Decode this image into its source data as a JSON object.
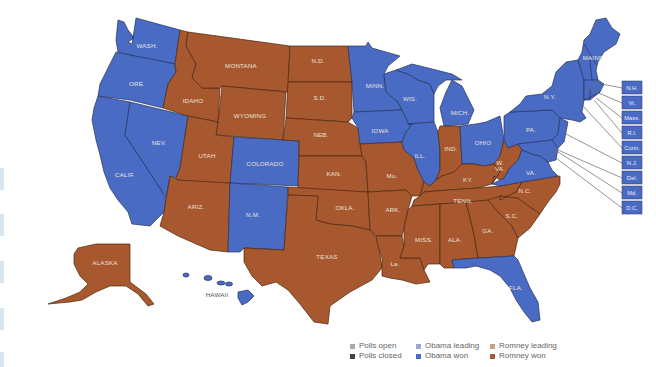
{
  "colors": {
    "obama_won": "#4a6bc4",
    "romney_won": "#a8582f",
    "polls_open": "#a9a9a9",
    "polls_closed": "#444444",
    "obama_leading": "#9aa8cf",
    "romney_leading": "#c9a08a"
  },
  "states": {
    "WA": {
      "label": "WASH.",
      "winner": "obama"
    },
    "OR": {
      "label": "ORE.",
      "winner": "obama"
    },
    "CA": {
      "label": "CALIF.",
      "winner": "obama"
    },
    "NV": {
      "label": "NEV.",
      "winner": "obama"
    },
    "ID": {
      "label": "IDAHO",
      "winner": "romney"
    },
    "MT": {
      "label": "MONTANA",
      "winner": "romney"
    },
    "WY": {
      "label": "WYOMING",
      "winner": "romney"
    },
    "UT": {
      "label": "UTAH",
      "winner": "romney"
    },
    "CO": {
      "label": "COLORADO",
      "winner": "obama"
    },
    "AZ": {
      "label": "ARIZ.",
      "winner": "romney"
    },
    "NM": {
      "label": "N.M.",
      "winner": "obama"
    },
    "ND": {
      "label": "N.D.",
      "winner": "romney"
    },
    "SD": {
      "label": "S.D.",
      "winner": "romney"
    },
    "NE": {
      "label": "NEB.",
      "winner": "romney"
    },
    "KS": {
      "label": "KAN.",
      "winner": "romney"
    },
    "OK": {
      "label": "OKLA.",
      "winner": "romney"
    },
    "TX": {
      "label": "TEXAS",
      "winner": "romney"
    },
    "MN": {
      "label": "MINN.",
      "winner": "obama"
    },
    "IA": {
      "label": "IOWA",
      "winner": "obama"
    },
    "MO": {
      "label": "Mo.",
      "winner": "romney"
    },
    "AR": {
      "label": "ARK.",
      "winner": "romney"
    },
    "LA": {
      "label": "La.",
      "winner": "romney"
    },
    "WI": {
      "label": "WIS.",
      "winner": "obama"
    },
    "IL": {
      "label": "ILL.",
      "winner": "obama"
    },
    "MI": {
      "label": "MICH.",
      "winner": "obama"
    },
    "IN": {
      "label": "IND.",
      "winner": "romney"
    },
    "OH": {
      "label": "OHIO",
      "winner": "obama"
    },
    "KY": {
      "label": "KY.",
      "winner": "romney"
    },
    "TN": {
      "label": "TENN.",
      "winner": "romney"
    },
    "MS": {
      "label": "MISS.",
      "winner": "romney"
    },
    "AL": {
      "label": "ALA.",
      "winner": "romney"
    },
    "GA": {
      "label": "GA.",
      "winner": "romney"
    },
    "FL": {
      "label": "FLA.",
      "winner": "obama"
    },
    "SC": {
      "label": "S.C.",
      "winner": "romney"
    },
    "NC": {
      "label": "N.C.",
      "winner": "romney"
    },
    "VA": {
      "label": "VA.",
      "winner": "obama"
    },
    "WV": {
      "label": "W.",
      "label2": "VA.",
      "winner": "romney"
    },
    "PA": {
      "label": "PA.",
      "winner": "obama"
    },
    "NY": {
      "label": "N.Y.",
      "winner": "obama"
    },
    "ME": {
      "label": "MAINE",
      "winner": "obama"
    },
    "AK": {
      "label": "ALASKA",
      "winner": "romney"
    },
    "HI": {
      "label": "HAWAII",
      "winner": "obama"
    }
  },
  "callouts": [
    {
      "label": "N.H.",
      "winner": "obama"
    },
    {
      "label": "Vt.",
      "winner": "obama"
    },
    {
      "label": "Mass.",
      "winner": "obama"
    },
    {
      "label": "R.I.",
      "winner": "obama"
    },
    {
      "label": "Conn.",
      "winner": "obama"
    },
    {
      "label": "N.J.",
      "winner": "obama"
    },
    {
      "label": "Del.",
      "winner": "obama"
    },
    {
      "label": "Md.",
      "winner": "obama"
    },
    {
      "label": "D.C.",
      "winner": "obama"
    }
  ],
  "legend": {
    "items": [
      {
        "label": "Polls open",
        "color": "#a9a9a9"
      },
      {
        "label": "Obama leading",
        "color": "#9aa8cf"
      },
      {
        "label": "Romney leading",
        "color": "#c9a08a"
      },
      {
        "label": "Polls closed",
        "color": "#444444"
      },
      {
        "label": "Obama won",
        "color": "#4a6bc4"
      },
      {
        "label": "Romney won",
        "color": "#a8582f"
      }
    ]
  }
}
